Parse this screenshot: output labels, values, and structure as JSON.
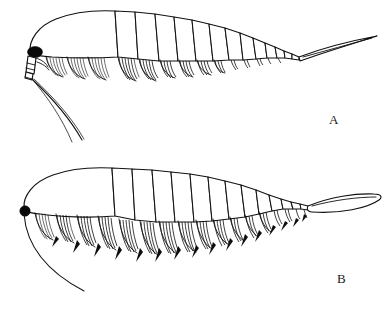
{
  "figure": {
    "background_color": "#ffffff",
    "ink_color": "#111111",
    "width": 384,
    "height": 313,
    "style": "scientific line drawing, black ink on white"
  },
  "panels": [
    {
      "id": "A",
      "label": "A",
      "label_x": 329,
      "label_y": 112,
      "description": "Upper specimen, lateral view facing left, slender pointed tail",
      "body": {
        "orientation": "facing-left",
        "carapace_segments": 1,
        "trunk_segments": 13,
        "setae_rows": 9,
        "tail_type": "narrow-pointed-spike",
        "eye_style": "hatched-compound-eye",
        "antennae_count": 2
      }
    },
    {
      "id": "B",
      "label": "B",
      "label_x": 337,
      "label_y": 271,
      "description": "Lower specimen, lateral view facing left, broad lanceolate paddle tail",
      "body": {
        "orientation": "facing-left",
        "carapace_segments": 1,
        "trunk_segments": 13,
        "setae_rows": 13,
        "tail_type": "lanceolate-paddle-telson",
        "eye_style": "solid-black-round-eye",
        "antennae_count": 1
      }
    }
  ]
}
